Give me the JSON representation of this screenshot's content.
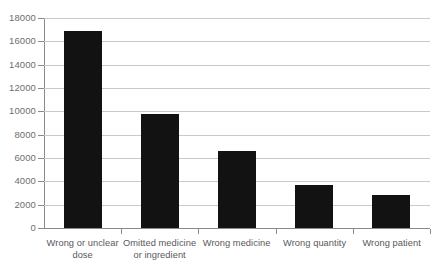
{
  "chart_data": {
    "type": "bar",
    "title": "",
    "subtitle": "",
    "xlabel": "",
    "ylabel": "",
    "categories": [
      "Wrong or unclear dose",
      "Omitted medicine or ingredient",
      "Wrong medicine",
      "Wrong quantity",
      "Wrong patient"
    ],
    "values": [
      16900,
      9800,
      6600,
      3700,
      2850
    ],
    "ylim": [
      0,
      18000
    ],
    "ytick_labels": [
      "18000",
      "16000",
      "14000",
      "12000",
      "10000",
      "8000",
      "6000",
      "4000",
      "2000",
      "0"
    ],
    "ytick_values": [
      18000,
      16000,
      14000,
      12000,
      10000,
      8000,
      6000,
      4000,
      2000,
      0
    ],
    "grid": true,
    "grid_axis": "y",
    "legend": false,
    "legend_position": "none",
    "bar_color": "#121212",
    "gridline_color": "#c9c9c9",
    "axis_color": "#8a8a8a",
    "tick_label_color": "#6d6e71",
    "category_label_color": "#58595b"
  }
}
